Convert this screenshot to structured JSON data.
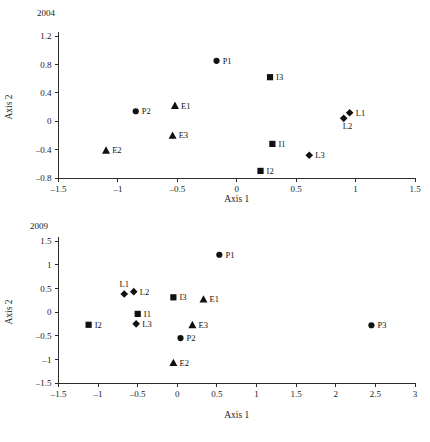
{
  "figure": {
    "panels": [
      {
        "id": "2004",
        "title": "2004",
        "xlabel": "Axis 1",
        "ylabel": "Axis 2"
      },
      {
        "id": "2009",
        "title": "2009",
        "xlabel": "Axis 1",
        "ylabel": "Axis 2"
      }
    ]
  },
  "chart_data": [
    {
      "type": "scatter",
      "title": "2004",
      "xlabel": "Axis 1",
      "ylabel": "Axis 2",
      "xlim": [
        -1.5,
        1.5
      ],
      "ylim": [
        -0.8,
        1.2
      ],
      "xticks": [
        "-1.5",
        "-1",
        "-0.5",
        "0",
        "0.5",
        "1",
        "1.5"
      ],
      "xtick_values": [
        -1.5,
        -1,
        -0.5,
        0,
        0.5,
        1,
        1.5
      ],
      "yticks": [
        "1.2",
        "0.8",
        "0.4",
        "0",
        "-0.4",
        "-0.8"
      ],
      "ytick_values": [
        1.2,
        0.8,
        0.4,
        0,
        -0.4,
        -0.8
      ],
      "grid": false,
      "legend": "none",
      "series": [
        {
          "name": "P",
          "marker": "circle",
          "points": [
            {
              "label": "P1",
              "x": -0.17,
              "y": 0.85,
              "label_pos": "right"
            },
            {
              "label": "P2",
              "x": -0.85,
              "y": 0.14,
              "label_pos": "right"
            }
          ]
        },
        {
          "name": "E",
          "marker": "triangle",
          "points": [
            {
              "label": "E1",
              "x": -0.52,
              "y": 0.22,
              "label_pos": "right"
            },
            {
              "label": "E2",
              "x": -1.1,
              "y": -0.41,
              "label_pos": "right"
            },
            {
              "label": "E3",
              "x": -0.54,
              "y": -0.2,
              "label_pos": "right"
            }
          ]
        },
        {
          "name": "I",
          "marker": "square",
          "points": [
            {
              "label": "I1",
              "x": 0.3,
              "y": -0.32,
              "label_pos": "right"
            },
            {
              "label": "I2",
              "x": 0.2,
              "y": -0.7,
              "label_pos": "right"
            },
            {
              "label": "I3",
              "x": 0.28,
              "y": 0.62,
              "label_pos": "right"
            }
          ]
        },
        {
          "name": "L",
          "marker": "diamond",
          "points": [
            {
              "label": "L1",
              "x": 0.95,
              "y": 0.12,
              "label_pos": "right"
            },
            {
              "label": "L2",
              "x": 0.9,
              "y": 0.04,
              "label_pos": "below-right"
            },
            {
              "label": "L3",
              "x": 0.61,
              "y": -0.48,
              "label_pos": "right"
            }
          ]
        }
      ]
    },
    {
      "type": "scatter",
      "title": "2009",
      "xlabel": "Axis 1",
      "ylabel": "Axis 2",
      "xlim": [
        -1.5,
        3
      ],
      "ylim": [
        -1.5,
        1.5
      ],
      "xticks": [
        "-1.5",
        "-1",
        "-0.5",
        "0",
        "0.5",
        "1",
        "1.5",
        "2",
        "2.5",
        "3"
      ],
      "xtick_values": [
        -1.5,
        -1,
        -0.5,
        0,
        0.5,
        1,
        1.5,
        2,
        2.5,
        3
      ],
      "yticks": [
        "1.5",
        "1",
        "0.5",
        "0",
        "-0.5",
        "-1",
        "-1.5"
      ],
      "ytick_values": [
        1.5,
        1,
        0.5,
        0,
        -0.5,
        -1,
        -1.5
      ],
      "grid": false,
      "legend": "none",
      "series": [
        {
          "name": "P",
          "marker": "circle",
          "points": [
            {
              "label": "P1",
              "x": 0.53,
              "y": 1.21,
              "label_pos": "right"
            },
            {
              "label": "P2",
              "x": 0.04,
              "y": -0.55,
              "label_pos": "right"
            },
            {
              "label": "P3",
              "x": 2.45,
              "y": -0.28,
              "label_pos": "right"
            }
          ]
        },
        {
          "name": "E",
          "marker": "triangle",
          "points": [
            {
              "label": "E1",
              "x": 0.33,
              "y": 0.27,
              "label_pos": "right"
            },
            {
              "label": "E2",
              "x": -0.05,
              "y": -1.07,
              "label_pos": "right"
            },
            {
              "label": "E3",
              "x": 0.19,
              "y": -0.27,
              "label_pos": "right"
            }
          ]
        },
        {
          "name": "I",
          "marker": "square",
          "points": [
            {
              "label": "I1",
              "x": -0.5,
              "y": -0.04,
              "label_pos": "right"
            },
            {
              "label": "I2",
              "x": -1.12,
              "y": -0.27,
              "label_pos": "right"
            },
            {
              "label": "I3",
              "x": -0.05,
              "y": 0.31,
              "label_pos": "right"
            }
          ]
        },
        {
          "name": "L",
          "marker": "diamond",
          "points": [
            {
              "label": "L1",
              "x": -0.67,
              "y": 0.38,
              "label_pos": "above"
            },
            {
              "label": "L2",
              "x": -0.55,
              "y": 0.43,
              "label_pos": "right"
            },
            {
              "label": "L3",
              "x": -0.52,
              "y": -0.25,
              "label_pos": "right"
            }
          ]
        }
      ]
    }
  ]
}
